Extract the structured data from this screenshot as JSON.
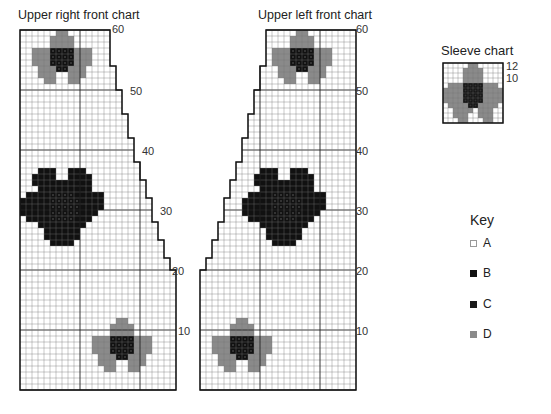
{
  "colors": {
    "A": "#ffffff",
    "B": "#111111",
    "C": "#111111",
    "D": "#8a8a8a",
    "grid": "#555555",
    "major": "#222222"
  },
  "charts": [
    {
      "id": "upper-right-front",
      "title": "Upper right front chart",
      "row_labels": [
        "60",
        "50",
        "40",
        "30",
        "20",
        "10"
      ],
      "cols": 26,
      "rows": 60,
      "shaping_side": "right",
      "edge_by_row": [
        [
          1,
          20,
          26
        ],
        [
          21,
          22,
          25
        ],
        [
          23,
          25,
          24
        ],
        [
          26,
          28,
          23
        ],
        [
          29,
          32,
          22
        ],
        [
          33,
          35,
          21
        ],
        [
          36,
          38,
          20
        ],
        [
          39,
          42,
          19
        ],
        [
          43,
          46,
          18
        ],
        [
          47,
          50,
          17
        ],
        [
          51,
          54,
          16
        ],
        [
          55,
          58,
          15
        ],
        [
          59,
          60,
          15
        ]
      ],
      "motifs": [
        {
          "type": "small-flower",
          "col": 13,
          "row": 1
        },
        {
          "type": "large-flower",
          "col": 1,
          "row": 22
        },
        {
          "type": "small-flower",
          "col": 1,
          "row": 48
        }
      ]
    },
    {
      "id": "upper-left-front",
      "title": "Upper left front chart",
      "row_labels": [
        "60",
        "50",
        "40",
        "30",
        "20",
        "10"
      ],
      "cols": 26,
      "rows": 60,
      "shaping_side": "left",
      "edge_by_row": [
        [
          1,
          20,
          26
        ],
        [
          21,
          22,
          25
        ],
        [
          23,
          25,
          24
        ],
        [
          26,
          28,
          23
        ],
        [
          29,
          32,
          22
        ],
        [
          33,
          35,
          21
        ],
        [
          36,
          38,
          20
        ],
        [
          39,
          42,
          19
        ],
        [
          43,
          46,
          18
        ],
        [
          47,
          50,
          17
        ],
        [
          51,
          54,
          16
        ],
        [
          55,
          58,
          15
        ],
        [
          59,
          60,
          15
        ]
      ],
      "motifs": [
        {
          "type": "small-flower",
          "col": 3,
          "row": 1
        },
        {
          "type": "large-flower",
          "col": 11,
          "row": 22
        },
        {
          "type": "small-flower",
          "col": 14,
          "row": 48
        }
      ]
    }
  ],
  "sleeve": {
    "title": "Sleeve chart",
    "row_labels": [
      "12",
      "10"
    ],
    "cols": 12,
    "rows": 12
  },
  "key": {
    "title": "Key",
    "items": [
      {
        "label": "A",
        "symbol": "empty"
      },
      {
        "label": "B",
        "symbol": "dot"
      },
      {
        "label": "C",
        "symbol": "solid"
      },
      {
        "label": "D",
        "symbol": "grey"
      }
    ]
  }
}
